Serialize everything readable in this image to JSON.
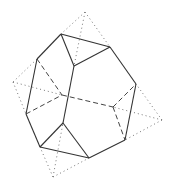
{
  "diagram": {
    "colors": {
      "solid": "#333333",
      "dashed": "#444444",
      "dotted": "#777777",
      "background": "#ffffff"
    },
    "vertices": {
      "A": [
        61,
        34
      ],
      "B": [
        110,
        47
      ],
      "C": [
        136,
        84
      ],
      "D": [
        125,
        140
      ],
      "E": [
        89,
        158
      ],
      "F": [
        40,
        147
      ],
      "G": [
        26,
        114
      ],
      "H": [
        37,
        59
      ],
      "I": [
        74,
        66
      ],
      "J": [
        63,
        123
      ],
      "K": [
        62,
        95
      ],
      "L": [
        113,
        107
      ],
      "Ptop": [
        85,
        12
      ],
      "Pleft": [
        13,
        82
      ],
      "Pright": [
        162,
        120
      ],
      "Pbottom": [
        53,
        177
      ]
    },
    "solid_edges": [
      [
        "A",
        "B"
      ],
      [
        "B",
        "C"
      ],
      [
        "C",
        "D"
      ],
      [
        "D",
        "E"
      ],
      [
        "E",
        "F"
      ],
      [
        "F",
        "G"
      ],
      [
        "G",
        "H"
      ],
      [
        "H",
        "A"
      ],
      [
        "A",
        "I"
      ],
      [
        "B",
        "I"
      ],
      [
        "I",
        "J"
      ],
      [
        "J",
        "F"
      ],
      [
        "J",
        "E"
      ]
    ],
    "hidden_edges": [
      [
        "H",
        "K"
      ],
      [
        "G",
        "K"
      ],
      [
        "K",
        "L"
      ],
      [
        "L",
        "C"
      ],
      [
        "L",
        "D"
      ]
    ],
    "dotted_edges": [
      [
        "Ptop",
        "A"
      ],
      [
        "Ptop",
        "B"
      ],
      [
        "Ptop",
        "I"
      ],
      [
        "Pleft",
        "H"
      ],
      [
        "Pleft",
        "G"
      ],
      [
        "Pleft",
        "K"
      ],
      [
        "Pright",
        "C"
      ],
      [
        "Pright",
        "D"
      ],
      [
        "Pright",
        "L"
      ],
      [
        "Pbottom",
        "F"
      ],
      [
        "Pbottom",
        "E"
      ],
      [
        "Pbottom",
        "J"
      ]
    ]
  }
}
